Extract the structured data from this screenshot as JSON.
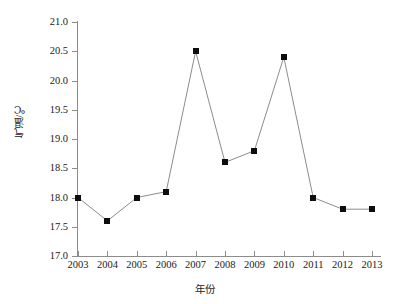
{
  "chart_data": {
    "type": "line",
    "title": "",
    "xlabel": "年份",
    "ylabel": "气温/℃",
    "categories": [
      "2003",
      "2004",
      "2005",
      "2006",
      "2007",
      "2008",
      "2009",
      "2010",
      "2011",
      "2012",
      "2013"
    ],
    "values": [
      18.0,
      17.6,
      18.0,
      18.1,
      20.5,
      18.6,
      18.8,
      20.4,
      18.0,
      17.8,
      17.8
    ],
    "series": [
      {
        "name": "气温",
        "values": [
          18.0,
          17.6,
          18.0,
          18.1,
          20.5,
          18.6,
          18.8,
          20.4,
          18.0,
          17.8,
          17.8
        ]
      }
    ],
    "ylim": [
      17.0,
      21.0
    ],
    "ytick_labels": [
      "21.0",
      "20.5",
      "20.0",
      "19.5",
      "19.0",
      "18.5",
      "18.0",
      "17.5",
      "17.0"
    ],
    "ytick_values": [
      21.0,
      20.5,
      20.0,
      19.5,
      19.0,
      18.5,
      18.0,
      17.5,
      17.0
    ],
    "ystep": 0.5,
    "grid": false,
    "legend": "none",
    "marker": "filled-square",
    "marker_color": "#0d0d0d",
    "line_color": "#8c8c8c",
    "axis_color": "#8c8c8c",
    "background": "#ffffff"
  }
}
